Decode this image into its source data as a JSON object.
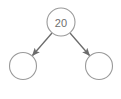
{
  "diagram": {
    "type": "tree",
    "background_color": "#ffffff",
    "width": 121,
    "height": 99,
    "node_stroke_color": "#9a9a9a",
    "node_fill_color": "#ffffff",
    "node_stroke_width": 1.1,
    "edge_color": "#6b6b6b",
    "edge_width": 1.3,
    "label_color": "#6e6e6e",
    "nodes": [
      {
        "id": "root",
        "label": "20",
        "cx": 61,
        "cy": 22,
        "r": 14,
        "role": "root-node"
      },
      {
        "id": "left-child",
        "label": "",
        "cx": 23,
        "cy": 66,
        "r": 13.5,
        "role": "left-child-node"
      },
      {
        "id": "right-child",
        "label": "",
        "cx": 99,
        "cy": 66,
        "r": 13.5,
        "role": "right-child-node"
      }
    ],
    "edges": [
      {
        "id": "root-to-left",
        "from": "root",
        "to": "left-child",
        "x1": 52.0,
        "y1": 33.0,
        "x2": 32.5,
        "y2": 55.5,
        "arrowhead": true,
        "label": ""
      },
      {
        "id": "root-to-right",
        "from": "root",
        "to": "right-child",
        "x1": 70.0,
        "y1": 33.0,
        "x2": 89.5,
        "y2": 55.5,
        "arrowhead": true,
        "label": ""
      }
    ]
  }
}
